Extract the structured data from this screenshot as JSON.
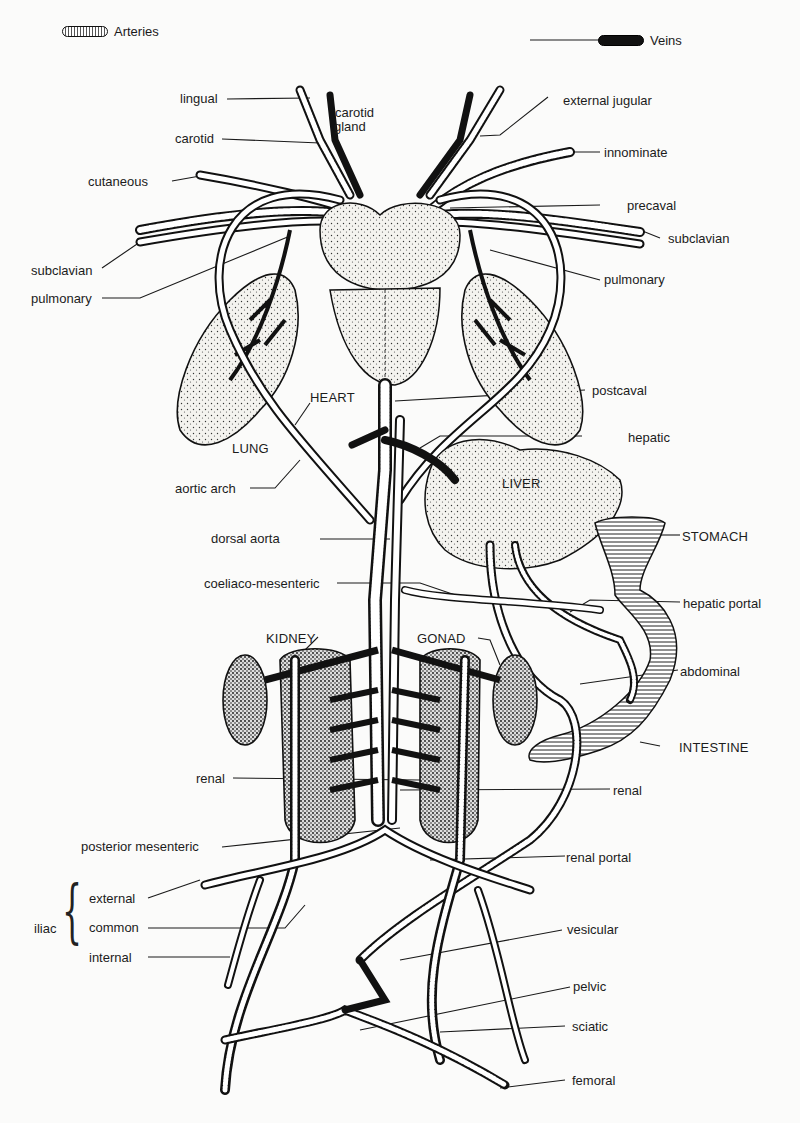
{
  "legend": {
    "arteries": "Arteries",
    "veins": "Veins"
  },
  "organs": {
    "heart": "HEART",
    "lung": "LUNG",
    "liver": "LIVER",
    "stomach": "STOMACH",
    "kidney": "KIDNEY",
    "gonad": "GONAD",
    "intestine": "INTESTINE"
  },
  "left_labels": {
    "lingual": "lingual",
    "carotid": "carotid",
    "cutaneous": "cutaneous",
    "subclavian": "subclavian",
    "pulmonary": "pulmonary",
    "aortic_arch": "aortic arch",
    "dorsal_aorta": "dorsal aorta",
    "coeliaco_mesenteric": "coeliaco-mesenteric",
    "renal": "renal",
    "posterior_mesenteric": "posterior mesenteric"
  },
  "iliac": {
    "group": "iliac",
    "external": "external",
    "common": "common",
    "internal": "internal"
  },
  "right_labels": {
    "carotid_gland_1": "carotid",
    "carotid_gland_2": "gland",
    "external_jugular": "external jugular",
    "innominate": "innominate",
    "precaval": "precaval",
    "subclavian": "subclavian",
    "pulmonary": "pulmonary",
    "postcaval": "postcaval",
    "hepatic": "hepatic",
    "hepatic_portal": "hepatic portal",
    "abdominal": "abdominal",
    "renal": "renal",
    "renal_portal": "renal portal",
    "vesicular": "vesicular",
    "pelvic": "pelvic",
    "sciatic": "sciatic",
    "femoral": "femoral"
  }
}
